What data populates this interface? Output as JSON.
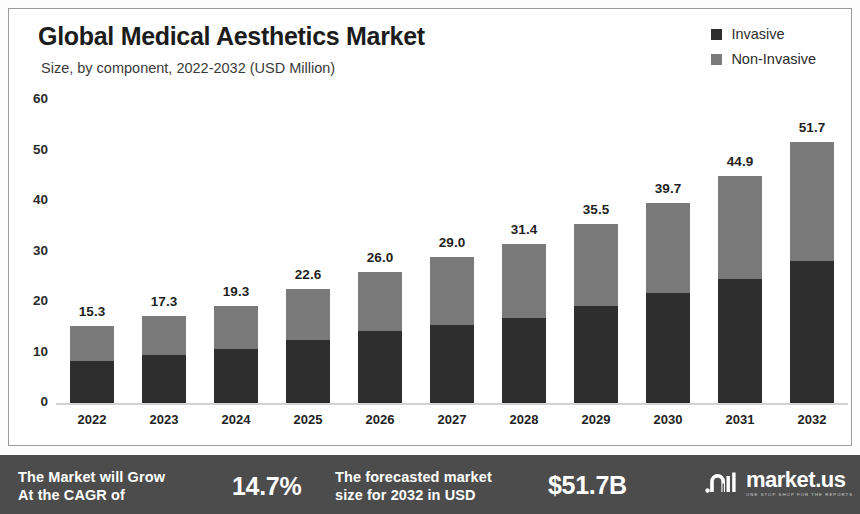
{
  "header": {
    "title": "Global Medical Aesthetics Market",
    "subtitle": "Size, by component, 2022-2032 (USD Million)"
  },
  "legend": {
    "items": [
      {
        "label": "Invasive",
        "color": "#2e2e2e"
      },
      {
        "label": "Non-Invasive",
        "color": "#7a7a7a"
      }
    ]
  },
  "banner": {
    "cagr_text": "The Market will Grow\nAt the CAGR of",
    "cagr_line1": "The Market will Grow",
    "cagr_line2": "At the CAGR of",
    "cagr_value": "14.7%",
    "forecast_line1": "The forecasted market",
    "forecast_line2": "size for 2032 in USD",
    "forecast_value": "$51.7B",
    "logo_name": "market.us",
    "logo_tagline": "ONE STOP SHOP FOR THE REPORTS",
    "background": "#4c4c4c"
  },
  "chart_data": {
    "type": "bar",
    "stacked": true,
    "title": "Global Medical Aesthetics Market",
    "subtitle": "Size, by component, 2022-2032 (USD Million)",
    "xlabel": "",
    "ylabel": "",
    "ylim": [
      0,
      60
    ],
    "yticks": [
      0,
      10,
      20,
      30,
      40,
      50,
      60
    ],
    "grid": false,
    "legend_position": "top-right",
    "categories": [
      "2022",
      "2023",
      "2024",
      "2025",
      "2026",
      "2027",
      "2028",
      "2029",
      "2030",
      "2031",
      "2032"
    ],
    "series": [
      {
        "name": "Invasive",
        "color": "#2e2e2e",
        "values": [
          8.4,
          9.5,
          10.6,
          12.5,
          14.2,
          15.5,
          16.9,
          19.2,
          21.7,
          24.5,
          28.2
        ]
      },
      {
        "name": "Non-Invasive",
        "color": "#7a7a7a",
        "values": [
          6.9,
          7.8,
          8.7,
          10.1,
          11.8,
          13.5,
          14.5,
          16.3,
          18.0,
          20.4,
          23.5
        ]
      }
    ],
    "totals": [
      15.3,
      17.3,
      19.3,
      22.6,
      26.0,
      29.0,
      31.4,
      35.5,
      39.7,
      44.9,
      51.7
    ],
    "total_labels": [
      "15.3",
      "17.3",
      "19.3",
      "22.6",
      "26.0",
      "29.0",
      "31.4",
      "35.5",
      "39.7",
      "44.9",
      "51.7"
    ],
    "ytick_labels": [
      "60",
      "50",
      "40",
      "30",
      "20",
      "10",
      "0"
    ]
  }
}
